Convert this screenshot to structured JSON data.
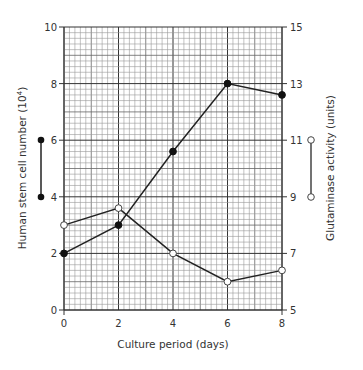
{
  "chart_data": {
    "type": "line",
    "title": "",
    "xlabel": "Culture period (days)",
    "ylabel": "Human stem cell number (10⁴)",
    "ylabel_base": "Human stem cell number (10",
    "ylabel_exp": "4",
    "ylabel_close": ")",
    "y2label": "Glutaminase activity (units)",
    "x": [
      0,
      2,
      4,
      6,
      8
    ],
    "xlim": [
      0,
      8
    ],
    "ylim": [
      0,
      10
    ],
    "y2lim": [
      5,
      15
    ],
    "x_ticks": [
      0,
      2,
      4,
      6,
      8
    ],
    "y_ticks": [
      0,
      2,
      4,
      6,
      8,
      10
    ],
    "y2_ticks": [
      5,
      7,
      9,
      11,
      13,
      15
    ],
    "grid": true,
    "series": [
      {
        "name": "Human stem cell number",
        "axis": "left",
        "marker": "filled-circle",
        "values": [
          2.0,
          3.0,
          5.6,
          8.0,
          7.6
        ]
      },
      {
        "name": "Glutaminase activity",
        "axis": "right",
        "marker": "open-circle",
        "values": [
          8.0,
          8.6,
          7.0,
          6.0,
          6.4
        ]
      }
    ],
    "legend": {
      "left_key": "filled-circle line marker beside left axis",
      "right_key": "open-circle line marker beside right axis"
    }
  }
}
